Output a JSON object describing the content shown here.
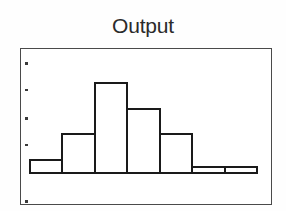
{
  "figure": {
    "title": "Output",
    "background_color": "#fefefe",
    "frame_color": "#4a4a4a",
    "bar_edge_color": "#1a1a1a",
    "bar_fill_color": "#ffffff",
    "tick_color": "#3a3a3a"
  },
  "chart_data": {
    "type": "bar",
    "title": "Output",
    "xlabel": "",
    "ylabel": "",
    "grid": false,
    "legend": null,
    "style": "histogram",
    "note": "Histogram of output values; bars drawn as unfilled white rectangles with black outlines inside a thin rectangular frame. Axis tick marks appear as five small dots along the inner left edge; no numeric tick labels are printed.",
    "categories": [
      "1",
      "2",
      "3",
      "4",
      "5",
      "6",
      "7"
    ],
    "values": [
      1,
      3,
      7,
      5,
      3,
      0.5,
      0.5
    ],
    "bar_count": 7,
    "ylim": [
      0,
      8
    ],
    "xlim": [
      0,
      7
    ],
    "y_tick_count": 5,
    "y_tick_labels": [
      "",
      "",
      "",
      "",
      ""
    ],
    "x_tick_labels": [
      "",
      "",
      "",
      "",
      "",
      "",
      ""
    ],
    "bars": [
      {
        "index": 0,
        "x_start": 0.0,
        "x_end": 1.0,
        "height": 1.0
      },
      {
        "index": 1,
        "x_start": 1.0,
        "x_end": 2.0,
        "height": 3.0
      },
      {
        "index": 2,
        "x_start": 2.0,
        "x_end": 3.0,
        "height": 7.0
      },
      {
        "index": 3,
        "x_start": 3.0,
        "x_end": 4.0,
        "height": 5.0
      },
      {
        "index": 4,
        "x_start": 4.0,
        "x_end": 5.0,
        "height": 3.0
      },
      {
        "index": 5,
        "x_start": 5.0,
        "x_end": 6.0,
        "height": 0.5
      },
      {
        "index": 6,
        "x_start": 6.0,
        "x_end": 7.0,
        "height": 0.5
      }
    ]
  },
  "axis": {
    "y_tick_dots": [
      {
        "position_fraction": 0.09
      },
      {
        "position_fraction": 0.26
      },
      {
        "position_fraction": 0.44
      },
      {
        "position_fraction": 0.61
      },
      {
        "position_fraction": 0.97
      }
    ]
  }
}
